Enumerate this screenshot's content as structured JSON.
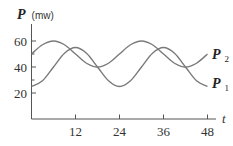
{
  "chart_data": {
    "type": "line",
    "title": "",
    "xlabel": "t",
    "ylabel": "P (mw)",
    "ylabel_var": "P",
    "ylabel_unit": "(mw)",
    "xlim": [
      0,
      48
    ],
    "ylim": [
      0,
      70
    ],
    "x_ticks": [
      12,
      24,
      36,
      48
    ],
    "x_tick_labels": [
      "12",
      "24",
      "36",
      "48"
    ],
    "y_ticks": [
      20,
      40,
      60
    ],
    "y_tick_labels": [
      "20",
      "40",
      "60"
    ],
    "y_minor_ticks": [
      30,
      50
    ],
    "grid": false,
    "legend_position": "inline-right",
    "x": [
      0,
      3,
      6,
      9,
      12,
      15,
      18,
      21,
      24,
      27,
      30,
      33,
      36,
      39,
      42,
      45,
      48
    ],
    "series": [
      {
        "name": "P1",
        "label_main": "P",
        "label_sub": "1",
        "formula_estimate": "40 - 15*cos(pi*t/12)",
        "values": [
          25,
          29.4,
          40,
          50.6,
          55,
          50.6,
          40,
          29.4,
          25,
          29.4,
          40,
          50.6,
          55,
          50.6,
          40,
          29.4,
          25
        ]
      },
      {
        "name": "P2",
        "label_main": "P",
        "label_sub": "2",
        "formula_estimate": "50 + 10*sin(pi*t/12)",
        "values": [
          50,
          57.1,
          60,
          57.1,
          50,
          42.9,
          40,
          42.9,
          50,
          57.1,
          60,
          57.1,
          50,
          42.9,
          40,
          42.9,
          50
        ]
      }
    ]
  }
}
